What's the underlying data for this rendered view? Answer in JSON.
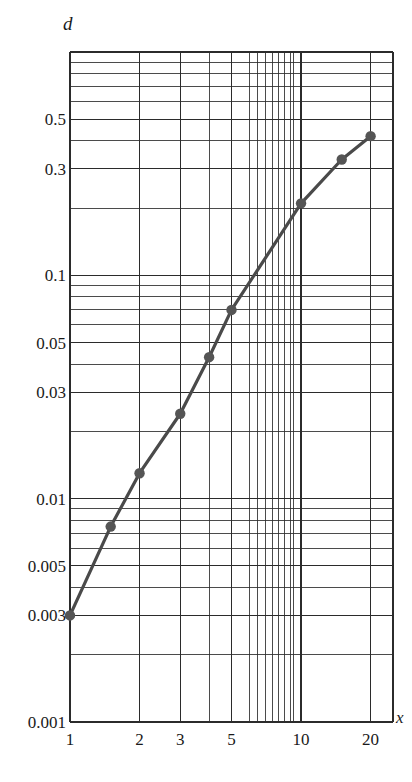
{
  "figure": {
    "background_color": "#ffffff",
    "ink_color": "#1a1a1a",
    "grid_color": "#2b2b2b",
    "curve_color": "#4a4a4a",
    "marker_color": "#555555"
  },
  "axes": {
    "x_variable_label": "x",
    "y_variable_label": "d",
    "x_scale": "log",
    "y_scale": "log",
    "x_range": [
      1,
      25
    ],
    "y_range": [
      0.001,
      1.0
    ],
    "x_tick_labels": [
      "1",
      "2",
      "3",
      "5",
      "10",
      "20"
    ],
    "x_tick_values": [
      1,
      2,
      3,
      5,
      10,
      20
    ],
    "y_tick_labels": [
      "0.5",
      "0.3",
      "0.1",
      "0.05",
      "0.03",
      "0.01",
      "0.005",
      "0.003",
      "0.001"
    ],
    "y_tick_values": [
      0.5,
      0.3,
      0.1,
      0.05,
      0.03,
      0.01,
      0.005,
      0.003,
      0.001
    ],
    "grid": "log-minor-and-major",
    "frame": "box"
  },
  "chart_data": {
    "type": "line",
    "title": "",
    "subtitle": "",
    "xlabel": "x",
    "ylabel": "d",
    "xscale": "log",
    "yscale": "log",
    "xlim": [
      1,
      25
    ],
    "ylim": [
      0.001,
      1.0
    ],
    "grid": true,
    "legend": null,
    "series": [
      {
        "name": "d(x)",
        "marker": "filled-circle",
        "x": [
          1,
          1.5,
          2,
          3,
          4,
          5,
          10,
          15,
          20
        ],
        "y": [
          0.003,
          0.0075,
          0.013,
          0.024,
          0.043,
          0.07,
          0.21,
          0.33,
          0.42
        ]
      }
    ],
    "annotations": []
  }
}
